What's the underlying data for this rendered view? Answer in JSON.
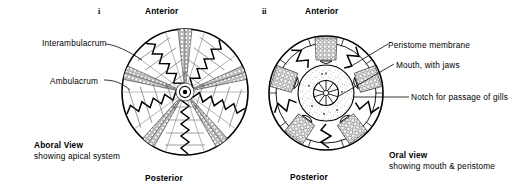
{
  "figure": {
    "background_color": "#ffffff",
    "ink_color": "#000000",
    "stipple_color": "#7a7a7a"
  },
  "panels": [
    {
      "id": "i",
      "number_label": "i",
      "orientation_top": "Anterior",
      "orientation_bottom": "Posterior",
      "caption_title": "Aboral View",
      "caption_sub": "showing apical system",
      "callouts": [
        {
          "name": "interambulacrum",
          "label": "Interambulacrum"
        },
        {
          "name": "ambulacrum",
          "label": "Ambulacrum"
        }
      ]
    },
    {
      "id": "ii",
      "number_label": "ii",
      "orientation_top": "Anterior",
      "orientation_bottom": "Posterior",
      "caption_title": "Oral view",
      "caption_sub": "showing mouth & peristome",
      "callouts": [
        {
          "name": "peristome-membrane",
          "label": "Peristome membrane"
        },
        {
          "name": "mouth-with-jaws",
          "label": "Mouth, with jaws"
        },
        {
          "name": "notch-for-gills",
          "label": "Notch for passage of gills"
        }
      ]
    }
  ]
}
